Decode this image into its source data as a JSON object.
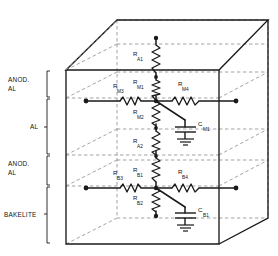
{
  "diagram": {
    "projection": "oblique-cube"
  },
  "layer_labels": [
    {
      "name": "layer-label-anod-al-top",
      "line1": "ANOD.",
      "line2": "AL"
    },
    {
      "name": "layer-label-al",
      "line1": "AL",
      "line2": ""
    },
    {
      "name": "layer-label-anod-al-bottom",
      "line1": "ANOD.",
      "line2": "AL"
    },
    {
      "name": "layer-label-bakelite",
      "line1": "BAKELITE",
      "line2": ""
    }
  ],
  "components": {
    "r_a1": {
      "symbol": "R",
      "sub": "A1"
    },
    "r_m3": {
      "symbol": "R",
      "sub": "M3"
    },
    "r_m1": {
      "symbol": "R",
      "sub": "M1"
    },
    "r_m4": {
      "symbol": "R",
      "sub": "M4"
    },
    "r_m2": {
      "symbol": "R",
      "sub": "M2"
    },
    "r_a2": {
      "symbol": "R",
      "sub": "A2"
    },
    "r_b3": {
      "symbol": "R",
      "sub": "B3"
    },
    "r_b1": {
      "symbol": "R",
      "sub": "B1"
    },
    "r_b4": {
      "symbol": "R",
      "sub": "B4"
    },
    "r_b2": {
      "symbol": "R",
      "sub": "B2"
    },
    "c_m1": {
      "symbol": "C",
      "sub": "M1"
    },
    "c_b1": {
      "symbol": "C",
      "sub": "B1"
    }
  },
  "colors": {
    "solid_line": "#1a1a1a",
    "dashed_line": "#8c8c8c",
    "background": "#ffffff"
  }
}
